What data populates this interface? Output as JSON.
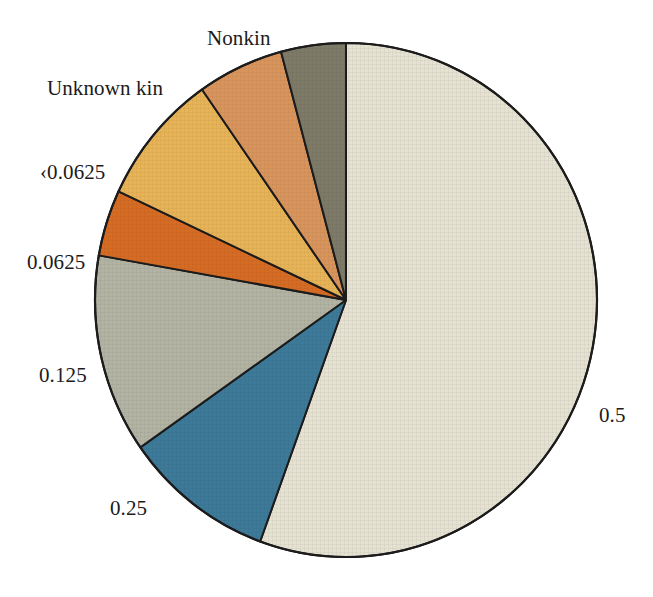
{
  "chart_data": {
    "type": "pie",
    "title": "",
    "subtitle": "",
    "xlabel": "",
    "ylabel": "",
    "legend_position": "none",
    "grid": false,
    "labels_placement": "outside-callout",
    "start_angle_deg": 0,
    "direction": "clockwise",
    "categories": [
      "0.5",
      "0.25",
      "0.125",
      "0.0625",
      "<0.0625",
      "Unknown kin",
      "Nonkin"
    ],
    "values": [
      55.6,
      9.7,
      12.5,
      4.2,
      8.3,
      5.6,
      11.1
    ],
    "units": "percent",
    "slices": [
      {
        "label": "0.5",
        "value": 55.6,
        "start_angle_deg": 0,
        "end_angle_deg": 200,
        "color": "#e6e2d2",
        "edge_color": "#1c1c1c"
      },
      {
        "label": "0.25",
        "value": 9.7,
        "start_angle_deg": 200,
        "end_angle_deg": 235,
        "color": "#3d7a99",
        "edge_color": "#1c1c1c"
      },
      {
        "label": "0.125",
        "value": 12.5,
        "start_angle_deg": 235,
        "end_angle_deg": 280,
        "color": "#b2b3a3",
        "edge_color": "#1c1c1c"
      },
      {
        "label": "0.0625",
        "value": 4.2,
        "start_angle_deg": 280,
        "end_angle_deg": 295,
        "color": "#d66c23",
        "edge_color": "#1c1c1c"
      },
      {
        "label": "<0.0625",
        "value": 8.3,
        "start_angle_deg": 295,
        "end_angle_deg": 325,
        "color": "#e7b356",
        "edge_color": "#1c1c1c"
      },
      {
        "label": "Unknown kin",
        "value": 5.6,
        "start_angle_deg": 325,
        "end_angle_deg": 345,
        "color": "#d9945c",
        "edge_color": "#1c1c1c"
      },
      {
        "label": "Nonkin",
        "value": 11.1,
        "start_angle_deg": 345,
        "end_angle_deg": 360,
        "color": "#7d7a68",
        "edge_color": "#1c1c1c"
      }
    ]
  },
  "labels": {
    "nonkin": "Nonkin",
    "unknown_kin": "Unknown kin",
    "lt_00625": "‹0.0625",
    "v_00625": "0.0625",
    "v_0125": "0.125",
    "v_025": "0.25",
    "v_05": "0.5"
  },
  "colors": {
    "background": "#ffffff",
    "outline": "#1c1c1c",
    "text": "#1b1b1b",
    "slice_05": "#e6e2d2",
    "slice_025": "#3d7a99",
    "slice_0125": "#b2b3a3",
    "slice_00625": "#d66c23",
    "slice_lt00625": "#e7b356",
    "slice_unknown_kin": "#d9945c",
    "slice_nonkin": "#7d7a68"
  }
}
